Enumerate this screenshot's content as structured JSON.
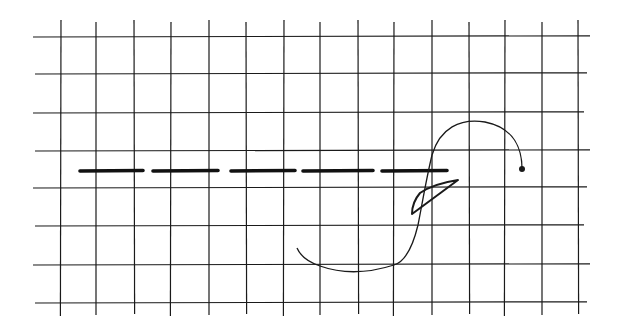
{
  "figure": {
    "colors": {
      "background": "#ffffff",
      "grid": "#1a1a1a",
      "dash": "#111111",
      "curve": "#1a1a1a"
    },
    "grid": {
      "vertical_x": [
        61,
        96,
        134,
        171,
        209,
        246,
        284,
        320,
        358,
        394,
        432,
        469,
        505,
        542,
        578
      ],
      "vertical_y_range": [
        20,
        316
      ],
      "horizontal_y": [
        37,
        74,
        113,
        151,
        188,
        226,
        265,
        303
      ],
      "horizontal_x_range": [
        33,
        590
      ]
    },
    "dashed_line": {
      "y": 171,
      "segments": [
        [
          80,
          143
        ],
        [
          153,
          218
        ],
        [
          231,
          295
        ],
        [
          303,
          373
        ],
        [
          382,
          447
        ]
      ]
    },
    "curve": {
      "path": "M 522 169 C 522 150, 515 128, 485 122 C 460 118, 440 128, 432 155 C 426 180, 422 205, 418 225 C 412 250, 404 262, 394 265 C 372 272, 345 275, 320 266 C 308 262, 300 255, 297 248",
      "end_dot": {
        "cx": 522,
        "cy": 169,
        "r": 3
      }
    },
    "leaf_loop": {
      "path": "M 458 180 C 445 182, 430 186, 420 193 C 414 200, 412 208, 412 214 L 458 180 Z"
    }
  }
}
